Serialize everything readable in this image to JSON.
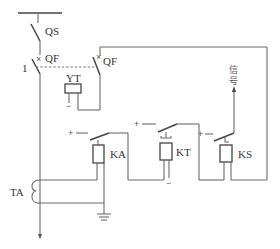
{
  "diagram": {
    "labels": {
      "qs": "QS",
      "qf_main": "QF",
      "qf_aux": "QF",
      "yt": "YT",
      "ka": "KA",
      "kt": "KT",
      "ks": "KS",
      "ta": "TA",
      "node_1": "1",
      "signal_line1": "信",
      "signal_line2": "号",
      "plus": "+",
      "minus": "−"
    },
    "components": [
      {
        "id": "QS",
        "type": "disconnector"
      },
      {
        "id": "QF",
        "type": "circuit-breaker"
      },
      {
        "id": "YT",
        "type": "trip-coil"
      },
      {
        "id": "KA",
        "type": "current-relay"
      },
      {
        "id": "KT",
        "type": "time-relay"
      },
      {
        "id": "KS",
        "type": "signal-relay"
      },
      {
        "id": "TA",
        "type": "current-transformer"
      }
    ],
    "colors": {
      "line": "#6a6a6a",
      "text": "#333333"
    }
  }
}
